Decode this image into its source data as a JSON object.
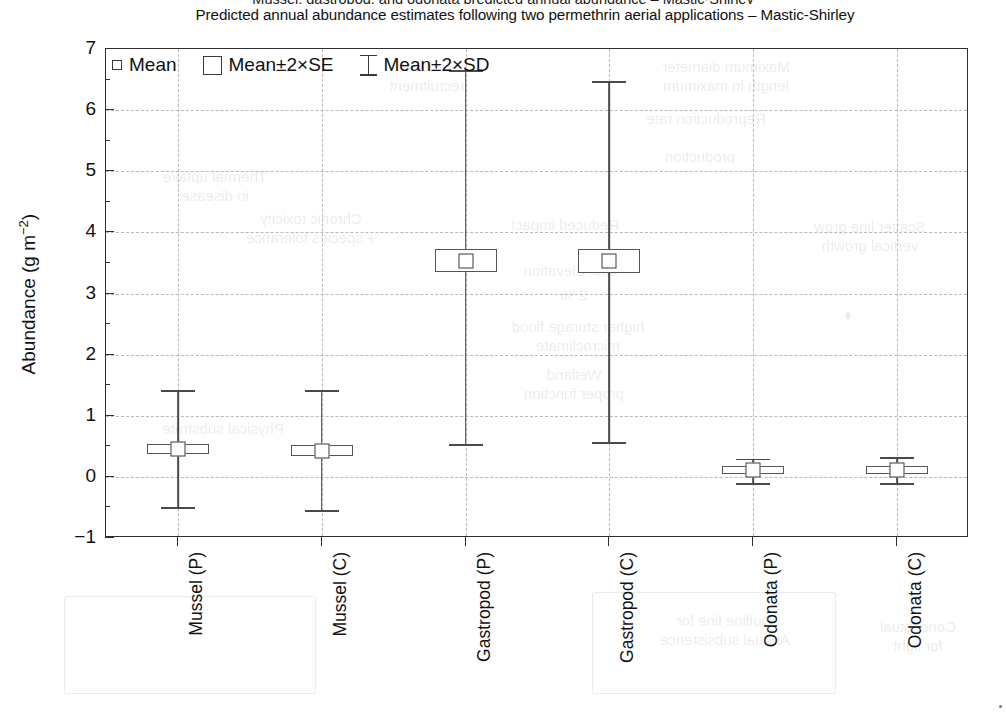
{
  "page": {
    "cut_off_line": "Mussel, gastropod, and odonata predicted annual abundance – Mastic-Shirley",
    "title": "Predicted annual abundance estimates following two permethrin aerial applications – Mastic-Shirley"
  },
  "legend": {
    "items": [
      {
        "label": "Mean",
        "marker": "small-square-marker"
      },
      {
        "label": "Mean±2×SE",
        "marker": "box-marker"
      },
      {
        "label": "Mean±2×SD",
        "marker": "whisker-marker"
      }
    ]
  },
  "axes": {
    "y_label_text": "Abundance (g m",
    "y_label_exponent": "−2",
    "y_label_close": ")",
    "y_label_full": "Abundance (g m−2)",
    "x_label": ""
  },
  "chart_data": {
    "type": "bar",
    "subtype": "mean-error-bar-plot",
    "title": "Predicted annual abundance estimates following two permethrin aerial applications – Mastic-Shirley",
    "xlabel": "",
    "ylabel": "Abundance (g m−2)",
    "ylim": [
      -1,
      7
    ],
    "ytick_values": [
      -1,
      0,
      1,
      2,
      3,
      4,
      5,
      6,
      7
    ],
    "ytick_labels": [
      "−1",
      "0",
      "1",
      "2",
      "3",
      "4",
      "5",
      "6",
      "7"
    ],
    "yminor_step": 0.5,
    "grid": "horizontal-and-vertical-dashed",
    "legend_position": "top-left-inside",
    "categories": [
      "Mussel (P)",
      "Mussel (C)",
      "Gastropod (P)",
      "Gastropod (C)",
      "Odonata (P)",
      "Odonata (C)"
    ],
    "series": [
      {
        "name": "Mean",
        "values": [
          0.46,
          0.43,
          3.53,
          3.53,
          0.11,
          0.11
        ]
      },
      {
        "name": "Mean−2×SE",
        "values": [
          0.37,
          0.34,
          3.35,
          3.33,
          0.05,
          0.05
        ]
      },
      {
        "name": "Mean+2×SE",
        "values": [
          0.54,
          0.52,
          3.72,
          3.72,
          0.17,
          0.17
        ]
      },
      {
        "name": "Mean−2×SD",
        "values": [
          -0.5,
          -0.55,
          0.53,
          0.57,
          -0.1,
          -0.1
        ]
      },
      {
        "name": "Mean+2×SD",
        "values": [
          1.42,
          1.42,
          6.65,
          6.47,
          0.3,
          0.32
        ]
      }
    ],
    "points": [
      {
        "category": "Mussel (P)",
        "mean": 0.46,
        "se_low": 0.37,
        "se_high": 0.54,
        "sd_low": -0.5,
        "sd_high": 1.42
      },
      {
        "category": "Mussel (C)",
        "mean": 0.43,
        "se_low": 0.34,
        "se_high": 0.52,
        "sd_low": -0.55,
        "sd_high": 1.42
      },
      {
        "category": "Gastropod (P)",
        "mean": 3.53,
        "se_low": 3.35,
        "se_high": 3.72,
        "sd_low": 0.53,
        "sd_high": 6.65
      },
      {
        "category": "Gastropod (C)",
        "mean": 3.53,
        "se_low": 3.33,
        "se_high": 3.72,
        "sd_low": 0.57,
        "sd_high": 6.47
      },
      {
        "category": "Odonata (P)",
        "mean": 0.11,
        "se_low": 0.05,
        "se_high": 0.17,
        "sd_low": -0.1,
        "sd_high": 0.3
      },
      {
        "category": "Odonata (C)",
        "mean": 0.11,
        "se_low": 0.05,
        "se_high": 0.17,
        "sd_low": -0.1,
        "sd_high": 0.32
      }
    ],
    "colors": {
      "line": "#4a4a4a",
      "box_fill": "#ffffff",
      "frame": "#2e2e2e",
      "grid": "#b9b9b9"
    }
  },
  "ghost_text": {
    "note": "faint mirrored bleed-through from the reverse side of the printed page",
    "blocks": [
      {
        "text": "Reduced\nrecruitment",
        "x": 352,
        "y": 58,
        "w": 150,
        "size": 15
      },
      {
        "text": "Maximum diameter\nlength in maximum",
        "x": 606,
        "y": 58,
        "w": 240,
        "size": 15
      },
      {
        "text": "Reproduction rate",
        "x": 596,
        "y": 110,
        "w": 220,
        "size": 15
      },
      {
        "text": "production",
        "x": 610,
        "y": 148,
        "w": 180,
        "size": 15
      },
      {
        "text": "Thermal uptake\nin disease",
        "x": 130,
        "y": 168,
        "w": 170,
        "size": 15
      },
      {
        "text": "Chronic toxicity\n+ species tolerance",
        "x": 206,
        "y": 210,
        "w": 210,
        "size": 15
      },
      {
        "text": "Reduced impact",
        "x": 470,
        "y": 216,
        "w": 190,
        "size": 15
      },
      {
        "text": "Scatter line grow\nvertical growth",
        "x": 770,
        "y": 218,
        "w": 200,
        "size": 15
      },
      {
        "text": "Max Elevation",
        "x": 486,
        "y": 262,
        "w": 170,
        "size": 15
      },
      {
        "text": "2 %",
        "x": 534,
        "y": 286,
        "w": 80,
        "size": 15
      },
      {
        "text": "higher storage flood\nmicroclimate",
        "x": 468,
        "y": 318,
        "w": 220,
        "size": 15
      },
      {
        "text": "Wetland\nproper function",
        "x": 474,
        "y": 366,
        "w": 200,
        "size": 15
      },
      {
        "text": "♦",
        "x": 828,
        "y": 306,
        "w": 40,
        "size": 15
      },
      {
        "text": "Physical substrate",
        "x": 128,
        "y": 420,
        "w": 190,
        "size": 15
      },
      {
        "text": "Outline line for\nAnnual subsistence",
        "x": 620,
        "y": 612,
        "w": 210,
        "size": 15
      },
      {
        "text": "Conceptual\nfor light",
        "x": 838,
        "y": 618,
        "w": 160,
        "size": 15
      }
    ],
    "boxes": [
      {
        "x": 64,
        "y": 596,
        "w": 250,
        "h": 96
      },
      {
        "x": 592,
        "y": 592,
        "w": 242,
        "h": 100
      },
      {
        "x": 60,
        "y": 142,
        "w": 210,
        "h": 0
      }
    ]
  }
}
